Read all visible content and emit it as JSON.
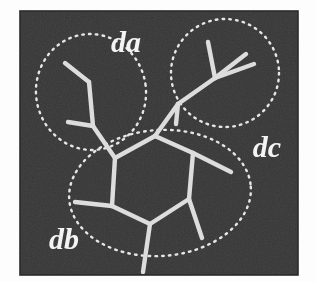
{
  "figure": {
    "kind": "micrograph-annotation",
    "panel": {
      "x": 20,
      "y": 11,
      "width": 278,
      "height": 264,
      "background_color": "#3a3a3a",
      "border_color": "#2c2c2c",
      "page_background_color": "#fdfdfd"
    },
    "bond_color": "#dcdcdc",
    "annotation_color": "#e8e8e8",
    "label_color": "#f2f2f2",
    "labels": [
      {
        "id": "da",
        "text": "da",
        "x": 126,
        "y": 41,
        "font_size": 30
      },
      {
        "id": "db",
        "text": "db",
        "x": 64,
        "y": 238,
        "font_size": 30
      },
      {
        "id": "dc",
        "text": "dc",
        "x": 267,
        "y": 146,
        "font_size": 30
      }
    ],
    "regions": [
      {
        "id": "da",
        "shape": "ellipse",
        "cx": 91,
        "cy": 92,
        "rx": 55,
        "ry": 58,
        "rotation": -8
      },
      {
        "id": "dc",
        "shape": "ellipse",
        "cx": 225,
        "cy": 73,
        "rx": 54,
        "ry": 54,
        "rotation": 0
      },
      {
        "id": "db",
        "shape": "ellipse",
        "cx": 160,
        "cy": 193,
        "rx": 91,
        "ry": 63,
        "rotation": -4
      }
    ],
    "bonds": [
      {
        "id": "ring-1",
        "x1": 115,
        "y1": 158,
        "x2": 155,
        "y2": 136
      },
      {
        "id": "ring-2",
        "x1": 155,
        "y1": 136,
        "x2": 193,
        "y2": 153
      },
      {
        "id": "ring-3",
        "x1": 193,
        "y1": 153,
        "x2": 189,
        "y2": 199
      },
      {
        "id": "ring-4",
        "x1": 189,
        "y1": 199,
        "x2": 150,
        "y2": 224
      },
      {
        "id": "ring-5",
        "x1": 150,
        "y1": 224,
        "x2": 112,
        "y2": 206
      },
      {
        "id": "ring-6",
        "x1": 112,
        "y1": 206,
        "x2": 115,
        "y2": 158
      },
      {
        "id": "sub-upper-left-stem",
        "x1": 115,
        "y1": 158,
        "x2": 93,
        "y2": 126
      },
      {
        "id": "sub-upper-left-branch-a",
        "x1": 93,
        "y1": 126,
        "x2": 68,
        "y2": 122
      },
      {
        "id": "sub-upper-left-branch-b",
        "x1": 93,
        "y1": 126,
        "x2": 89,
        "y2": 82
      },
      {
        "id": "sub-upper-left-branch-c",
        "x1": 89,
        "y1": 82,
        "x2": 65,
        "y2": 63
      },
      {
        "id": "sub-upper-right-stem",
        "x1": 155,
        "y1": 136,
        "x2": 178,
        "y2": 104
      },
      {
        "id": "sub-upper-right-node",
        "x1": 178,
        "y1": 104,
        "x2": 215,
        "y2": 78
      },
      {
        "id": "sub-ur-branch-a",
        "x1": 178,
        "y1": 104,
        "x2": 176,
        "y2": 124
      },
      {
        "id": "sub-ur-branch-b",
        "x1": 215,
        "y1": 78,
        "x2": 208,
        "y2": 42
      },
      {
        "id": "sub-ur-branch-c",
        "x1": 215,
        "y1": 78,
        "x2": 246,
        "y2": 54
      },
      {
        "id": "sub-ur-branch-d",
        "x1": 215,
        "y1": 78,
        "x2": 254,
        "y2": 64
      },
      {
        "id": "sub-right",
        "x1": 193,
        "y1": 153,
        "x2": 231,
        "y2": 172
      },
      {
        "id": "sub-lower-right",
        "x1": 189,
        "y1": 199,
        "x2": 202,
        "y2": 238
      },
      {
        "id": "sub-lower-left",
        "x1": 112,
        "y1": 206,
        "x2": 75,
        "y2": 202
      },
      {
        "id": "sub-bottom",
        "x1": 150,
        "y1": 224,
        "x2": 143,
        "y2": 272
      }
    ]
  }
}
